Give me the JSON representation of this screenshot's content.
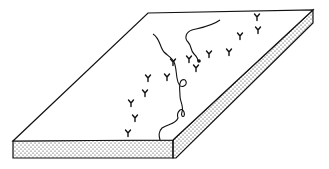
{
  "figure": {
    "colors": {
      "background": "#ffffff",
      "ink": "#111111",
      "stipple": "#222222"
    },
    "slab": {
      "top_face": [
        [
          148,
          13
        ],
        [
          313,
          10
        ],
        [
          173,
          140
        ],
        [
          13,
          141
        ]
      ],
      "front_face": [
        [
          13,
          141
        ],
        [
          173,
          140
        ],
        [
          173,
          158
        ],
        [
          13,
          158
        ]
      ],
      "side_face": [
        [
          173,
          140
        ],
        [
          313,
          10
        ],
        [
          313,
          23
        ],
        [
          176,
          158
        ],
        [
          173,
          158
        ]
      ]
    },
    "strands": [
      {
        "name": "left-strand",
        "path": "M153,34 C160,38 160,48 164,52 C168,56 172,58 174,62 C176,66 176,72 177,78 C178,84 180,88 184,86 C188,84 186,78 182,80 C178,82 180,90 180,96 C180,102 184,106 182,112 C180,118 186,118 184,112 C182,106 176,112 178,118 C176,124 168,124 162,128 C158,132 159,136 160,140"
      },
      {
        "name": "right-strand",
        "path": "M220,20 C212,26 200,28 192,30 C186,32 184,38 188,42 C192,46 190,50 194,54 C196,56 198,58 198,61"
      }
    ],
    "strand_end_dot": [
      199,
      61
    ],
    "y_markers": [
      [
        257,
        17
      ],
      [
        258,
        30
      ],
      [
        240,
        36
      ],
      [
        229,
        52
      ],
      [
        209,
        54
      ],
      [
        196,
        68
      ],
      [
        189,
        59
      ],
      [
        173,
        62
      ],
      [
        167,
        77
      ],
      [
        148,
        78
      ],
      [
        145,
        93
      ],
      [
        131,
        103
      ],
      [
        135,
        118
      ],
      [
        128,
        133
      ]
    ]
  }
}
